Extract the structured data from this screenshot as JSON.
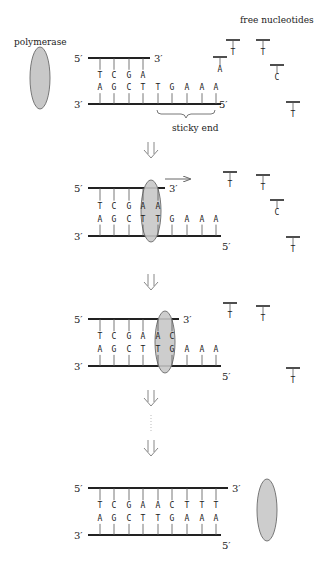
{
  "labels": {
    "polymerase": "polymerase",
    "free_nucleotides": "free nucleotides",
    "sticky_end": "sticky end",
    "five_prime": "5′",
    "three_prime": "3′"
  },
  "colors": {
    "polymerase_fill": "#c8c8c8",
    "strand": "#222222",
    "arrow": "#888888"
  },
  "panels": [
    {
      "top_strand": [
        "T",
        "C",
        "G",
        "A"
      ],
      "bottom_strand": [
        "A",
        "G",
        "C",
        "T",
        "T",
        "G",
        "A",
        "A",
        "A"
      ],
      "free": [
        {
          "base": "T",
          "x": 233,
          "y": 40
        },
        {
          "base": "A",
          "x": 220,
          "y": 57
        },
        {
          "base": "T",
          "x": 263,
          "y": 40
        },
        {
          "base": "C",
          "x": 277,
          "y": 65
        },
        {
          "base": "T",
          "x": 293,
          "y": 102
        }
      ]
    },
    {
      "top_strand": [
        "T",
        "C",
        "G",
        "A",
        "A"
      ],
      "bottom_strand": [
        "A",
        "G",
        "C",
        "T",
        "T",
        "G",
        "A",
        "A",
        "A"
      ],
      "free": [
        {
          "base": "T",
          "x": 230,
          "y": 172
        },
        {
          "base": "T",
          "x": 263,
          "y": 175
        },
        {
          "base": "C",
          "x": 277,
          "y": 200
        },
        {
          "base": "T",
          "x": 293,
          "y": 237
        }
      ]
    },
    {
      "top_strand": [
        "T",
        "C",
        "G",
        "A",
        "A",
        "C"
      ],
      "bottom_strand": [
        "A",
        "G",
        "C",
        "T",
        "T",
        "G",
        "A",
        "A",
        "A"
      ],
      "free": [
        {
          "base": "T",
          "x": 230,
          "y": 303
        },
        {
          "base": "T",
          "x": 263,
          "y": 306
        },
        {
          "base": "T",
          "x": 293,
          "y": 368
        }
      ]
    },
    {
      "top_strand": [
        "T",
        "C",
        "G",
        "A",
        "A",
        "C",
        "T",
        "T",
        "T"
      ],
      "bottom_strand": [
        "A",
        "G",
        "C",
        "T",
        "T",
        "G",
        "A",
        "A",
        "A"
      ],
      "free": []
    }
  ]
}
